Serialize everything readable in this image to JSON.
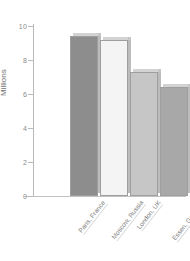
{
  "chart_data": {
    "type": "bar",
    "title": "",
    "xlabel": "",
    "ylabel": "Millions",
    "ylim": [
      0,
      10
    ],
    "yticks": [
      0,
      2,
      4,
      6,
      8,
      10
    ],
    "grid": false,
    "legend": "none",
    "categories": [
      "Paris, France",
      "Moscow, Russia",
      "London, UK",
      "Essen, Germany",
      "St. Petersburg, Germany"
    ],
    "values": [
      9.4,
      9.2,
      7.3,
      6.4,
      5.1
    ],
    "bar_colors": [
      "#8d8d8d",
      "#f4f4f4",
      "#c6c6c6",
      "#a8a8a8",
      "#d8d8d8"
    ]
  },
  "axis": {
    "y_title": "Millions",
    "tick_labels": [
      "0",
      "2",
      "4",
      "6",
      "8",
      "10"
    ]
  }
}
